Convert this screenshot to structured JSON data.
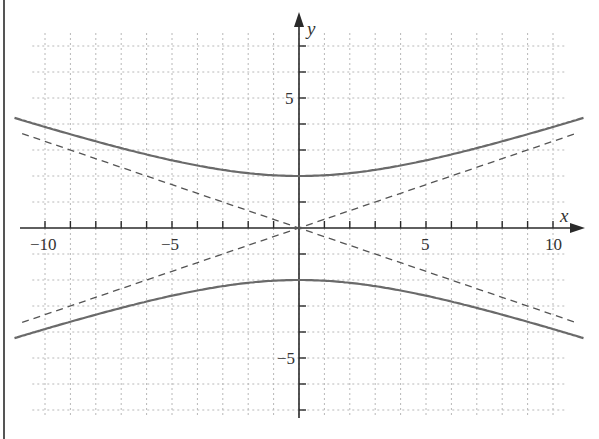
{
  "chart_data": {
    "type": "line",
    "title": "",
    "xlabel": "x",
    "ylabel": "y",
    "xlim": [
      -11,
      11
    ],
    "ylim": [
      -7.5,
      8
    ],
    "grid": true,
    "legend": null,
    "x_tick_labels": [
      "-10",
      "-5",
      "5",
      "10"
    ],
    "y_tick_labels": [
      "5",
      "-5"
    ],
    "series": [
      {
        "name": "hyperbola upper branch",
        "style": "solid",
        "equation": "y = 2*sqrt(1 + x^2/36)",
        "x": [
          -11,
          -10,
          -8,
          -6,
          -4,
          -2,
          0,
          2,
          4,
          6,
          8,
          10,
          11
        ],
        "values": [
          4.18,
          3.89,
          3.33,
          2.83,
          2.4,
          2.11,
          2.0,
          2.11,
          2.4,
          2.83,
          3.33,
          3.89,
          4.18
        ]
      },
      {
        "name": "hyperbola lower branch",
        "style": "solid",
        "equation": "y = -2*sqrt(1 + x^2/36)",
        "x": [
          -11,
          -10,
          -8,
          -6,
          -4,
          -2,
          0,
          2,
          4,
          6,
          8,
          10,
          11
        ],
        "values": [
          -4.18,
          -3.89,
          -3.33,
          -2.83,
          -2.4,
          -2.11,
          -2.0,
          -2.11,
          -2.4,
          -2.83,
          -3.33,
          -3.89,
          -4.18
        ]
      },
      {
        "name": "asymptote y = x/3",
        "style": "dashed",
        "x": [
          -11,
          0,
          11
        ],
        "values": [
          -3.67,
          0,
          3.67
        ]
      },
      {
        "name": "asymptote y = -x/3",
        "style": "dashed",
        "x": [
          -11,
          0,
          11
        ],
        "values": [
          3.67,
          0,
          -3.67
        ]
      }
    ]
  },
  "labels": {
    "x_axis": "x",
    "y_axis": "y",
    "xticks": {
      "neg10": "−10",
      "neg5": "−5",
      "pos5": "5",
      "pos10": "10"
    },
    "yticks": {
      "pos5": "5",
      "neg5": "−5"
    }
  }
}
